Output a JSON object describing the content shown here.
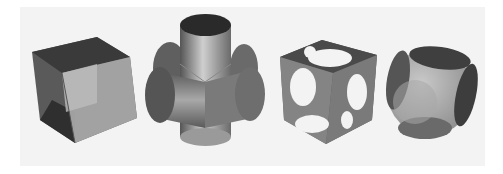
{
  "figure": {
    "background": "#f3f3f3",
    "shapes": [
      {
        "name": "cube",
        "description": "Translucent cube"
      },
      {
        "name": "three-cylinders",
        "description": "Union of three orthogonal cylinders"
      },
      {
        "name": "cube-minus-sphere",
        "description": "Cube with spherical cut-outs (difference)"
      },
      {
        "name": "cube-intersect-sphere",
        "description": "Intersection of cube and sphere"
      }
    ],
    "colors": {
      "dark": "#3a3a3a",
      "mid": "#6a6a6a",
      "light": "#9c9c9c",
      "highlight": "#c8c8c8"
    }
  }
}
